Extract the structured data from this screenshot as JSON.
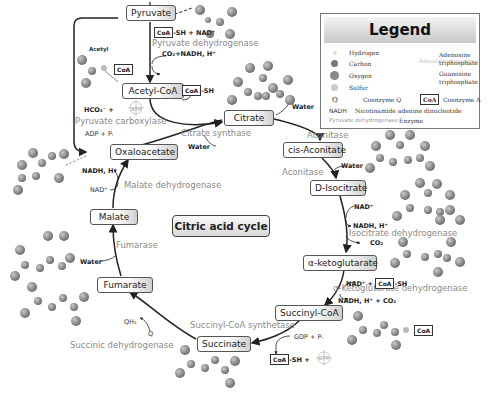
{
  "diagram": {
    "title": "Citric acid cycle",
    "metabolites": {
      "pyruvate": "Pyruvate",
      "acetyl_coa": "Acetyl-CoA",
      "citrate": "Citrate",
      "cis_aconitate": "cis-Aconitate",
      "d_isocitrate": "D-Isocitrate",
      "alpha_ketoglutarate": "α-ketoglutarate",
      "succinyl_coa": "Succinyl-CoA",
      "succinate": "Succinate",
      "fumarate": "Fumarate",
      "malate": "Malate",
      "oxaloacetate": "Oxaloacetate"
    },
    "enzymes": {
      "pyruvate_dehydrogenase": "Pyruvate dehydrogenase",
      "pyruvate_carboxylase": "Pyruvate carboxylase",
      "citrate_synthase": "Citrate synthase",
      "aconitase_1": "Aconitase",
      "aconitase_2": "Aconitase",
      "isocitrate_dehydrogenase": "Isocitrate dehydrogenase",
      "akg_dehydrogenase": "α-ketoglutarate dehydrogenase",
      "succinyl_coa_synthetase": "Succinyl-CoA synthetase",
      "succinic_dehydrogenase": "Succinic dehydrogenase",
      "fumarase": "Fumarase",
      "malate_dehydrogenase": "Malate dehydrogenase"
    },
    "cofactors": {
      "acetyl_label": "Acetyl",
      "pdh_in": "-SH + NAD⁺",
      "pdh_out": "CO₂+NADH, H⁺",
      "acoa_release": "-SH",
      "hco3": "HCO₃⁻ +",
      "adp_pi": "ADP + Pᵢ",
      "cs_water": "Water",
      "citrate_water": "Water",
      "aconitate_water": "Water",
      "idh_nad": "NAD⁺",
      "idh_nadh": "NADH, H⁺",
      "idh_co2": "CO₂",
      "akg_in_nad": "NAD⁺ +",
      "akg_in_sh": "-SH",
      "akg_out": "NADH, H⁺ + CO₂",
      "gdp_pi": "GDP + Pᵢ",
      "scs_sh": "-SH +",
      "qh2": "QH₂",
      "q": "Q",
      "fumarase_water": "Water",
      "mdh_nad": "NAD⁺",
      "mdh_nadh": "NADH, H⁺",
      "coa": "CoA",
      "atp": "ATP",
      "gtp": "GTP"
    }
  },
  "legend": {
    "title": "Legend",
    "items": {
      "hydrogen": "Hydrogen",
      "carbon": "Carbon",
      "oxygen": "Oxygen",
      "sulfur": "Sulfur",
      "atp": "Adenosine triphosphate",
      "gtp": "Guanosine triphosphate",
      "q_symbol": "Q",
      "q_label": "Coenzyme Q",
      "coa_symbol": "CoA",
      "coa_label": "Coenzyme A",
      "nadh_symbol": "NADH",
      "nadh_label": "Nicotinamide adenine dinucleotide",
      "enzyme_example": "Pyruvate dehydrogenase",
      "enzyme_label": "Enzyme"
    }
  },
  "colors": {
    "atom": "#8c8c8c",
    "enzyme_text": "#8a8a8a",
    "arrow": "#222222"
  }
}
